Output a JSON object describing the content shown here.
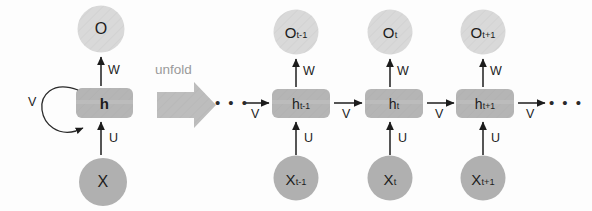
{
  "figure": {
    "transition_label": "unfold",
    "ellipsis": "• • •"
  },
  "colors": {
    "output_circle_fill": "#d9d9d9",
    "input_circle_fill": "#b0b0b0",
    "hidden_box_fill": "#b5b5b5",
    "hatch_stroke": "#cfcfcf",
    "arrow_stroke": "#1c1c1c",
    "unfold_arrow_fill": "#bdbdbd",
    "unfold_text": "#9a9a9a",
    "background": "#fdfdfd"
  },
  "folded": {
    "output": {
      "base": "O",
      "sub": ""
    },
    "hidden": {
      "base": "h",
      "sub": ""
    },
    "input": {
      "base": "X",
      "sub": ""
    },
    "weights": {
      "output_weight": "W",
      "input_weight": "U",
      "recurrent_weight": "V"
    }
  },
  "unfolded": {
    "left_ellipsis": "• • •",
    "right_ellipsis": "• • •",
    "incoming_weight": "V",
    "outgoing_weight": "V",
    "steps": [
      {
        "name": "t-1",
        "output": {
          "base": "O",
          "sub": "t-1"
        },
        "hidden": {
          "base": "h",
          "sub": "t-1"
        },
        "input": {
          "base": "X",
          "sub": "t-1"
        },
        "output_weight": "W",
        "input_weight": "U",
        "recurrent_weight": "V"
      },
      {
        "name": "t",
        "output": {
          "base": "O",
          "sub": "t"
        },
        "hidden": {
          "base": "h",
          "sub": "t"
        },
        "input": {
          "base": "X",
          "sub": "t"
        },
        "output_weight": "W",
        "input_weight": "U",
        "recurrent_weight": "V"
      },
      {
        "name": "t+1",
        "output": {
          "base": "O",
          "sub": "t+1"
        },
        "hidden": {
          "base": "h",
          "sub": "t+1"
        },
        "input": {
          "base": "X",
          "sub": "t+1"
        },
        "output_weight": "W",
        "input_weight": "U",
        "recurrent_weight": "V"
      }
    ]
  }
}
